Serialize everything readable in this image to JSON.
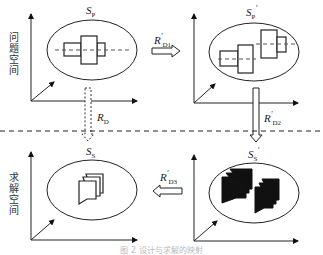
{
  "diagram": {
    "axis_labels": {
      "problem_space": "问题空间",
      "solution_space": "求解空间"
    },
    "sets": {
      "sp": {
        "symbol": "S",
        "sub": "P",
        "prime": ""
      },
      "sp_prime": {
        "symbol": "S",
        "sub": "P",
        "prime": "′"
      },
      "ss": {
        "symbol": "S",
        "sub": "S",
        "prime": ""
      },
      "ss_prime": {
        "symbol": "S",
        "sub": "S",
        "prime": "′"
      }
    },
    "relations": {
      "rd1": {
        "symbol": "R",
        "sub": "D1",
        "prime": "′"
      },
      "rd2": {
        "symbol": "R",
        "sub": "D2",
        "prime": "′"
      },
      "rd3": {
        "symbol": "R",
        "sub": "D3",
        "prime": "′"
      },
      "rd": {
        "symbol": "R",
        "sub": "D",
        "prime": ""
      }
    },
    "caption": "图 2  设计与求解的映射"
  }
}
